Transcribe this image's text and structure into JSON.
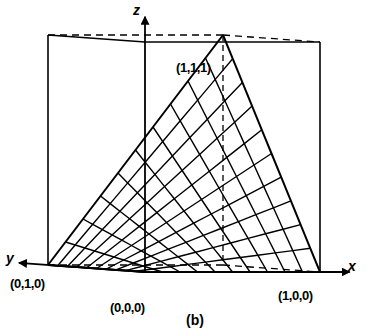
{
  "figure": {
    "caption": "(b)",
    "kind": "3d-surface-mesh-in-unit-cube",
    "background_color": "#ffffff",
    "line_color": "#000000"
  },
  "axes": [
    {
      "name": "x-axis",
      "label": "x",
      "arrow": true
    },
    {
      "name": "y-axis",
      "label": "y",
      "arrow": true
    },
    {
      "name": "z-axis",
      "label": "z",
      "arrow": true
    }
  ],
  "vertex_labels": [
    {
      "name": "origin-label",
      "text": "(0,0,0)"
    },
    {
      "name": "x-vertex-label",
      "text": "(1,0,0)"
    },
    {
      "name": "y-vertex-label",
      "text": "(0,1,0)"
    },
    {
      "name": "apex-vertex-label",
      "text": "(1,1,1)"
    }
  ],
  "chart_data": {
    "type": "line",
    "title": "(b)",
    "xlabel": "x",
    "ylabel": "y",
    "zlabel": "z",
    "surface": "z = x*y  (bilinear patch over the unit square)",
    "xlim": [
      0,
      1
    ],
    "ylim": [
      0,
      1
    ],
    "zlim": [
      0,
      1
    ],
    "grid": true,
    "grid_divisions": 10,
    "legend": "none",
    "annotations": [
      "(0,0,0)",
      "(1,0,0)",
      "(0,1,0)",
      "(1,1,1)",
      "(b)"
    ],
    "projection": {
      "origin_px": [
        145,
        272
      ],
      "x_unit_px": [
        320,
        272
      ],
      "y_unit_px": [
        48,
        265
      ],
      "z_unit_px": [
        145,
        42
      ],
      "hidden_base_px": [
        200,
        262
      ],
      "apex_px": [
        200,
        88
      ]
    },
    "cube_vertices": [
      {
        "label": "(0,0,0)",
        "px": [
          145,
          272
        ],
        "hidden": false
      },
      {
        "label": "(1,0,0)",
        "px": [
          320,
          272
        ],
        "hidden": false
      },
      {
        "label": "(0,1,0)",
        "px": [
          48,
          265
        ],
        "hidden": false
      },
      {
        "label": "(1,1,0)",
        "px": [
          200,
          262
        ],
        "hidden": true
      },
      {
        "label": "(0,0,1)",
        "px": [
          145,
          42
        ],
        "hidden": false
      },
      {
        "label": "(1,0,1)",
        "px": [
          320,
          62
        ],
        "hidden": false
      },
      {
        "label": "(0,1,1)",
        "px": [
          48,
          73
        ],
        "hidden": false
      },
      {
        "label": "(1,1,1)",
        "px": [
          200,
          88
        ],
        "hidden": true
      }
    ]
  }
}
